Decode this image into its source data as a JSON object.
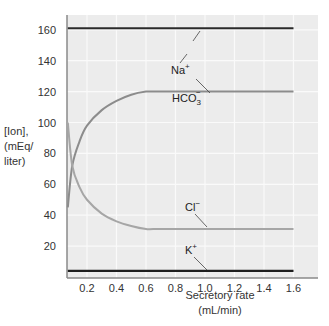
{
  "chart_data": {
    "type": "line",
    "title": "",
    "xlabel": "Secretory rate (mL/min)",
    "xlabel_lines": [
      "Secretory rate",
      "(mL/min)"
    ],
    "ylabel": "[Ion], (mEq/liter)",
    "ylabel_lines": [
      "[Ion],",
      "(mEq/",
      "liter)"
    ],
    "xlim": [
      0.07,
      1.75
    ],
    "ylim": [
      0,
      170
    ],
    "x_ticks": [
      0.2,
      0.4,
      0.6,
      0.8,
      1.0,
      1.2,
      1.4,
      1.6
    ],
    "x_tick_labels": [
      "0.2",
      "0.4",
      "0.6",
      "0.8",
      "1.0",
      "1.2",
      "1.4",
      "1.6"
    ],
    "y_ticks": [
      20,
      40,
      60,
      80,
      100,
      120,
      140,
      160
    ],
    "y_tick_labels": [
      "20",
      "40",
      "60",
      "80",
      "100",
      "120",
      "140",
      "160"
    ],
    "grid": true,
    "legend": "inline labels with leader lines",
    "series": [
      {
        "name": "Na+",
        "label": "Na",
        "superscript": "+",
        "color": "#2b2b2b",
        "x": [
          0.07,
          1.6
        ],
        "y": [
          161,
          161
        ]
      },
      {
        "name": "HCO3-",
        "label": "HCO",
        "subscript": "3",
        "superscript": "−",
        "color": "#8c8c8c",
        "x": [
          0.07,
          0.1,
          0.15,
          0.2,
          0.3,
          0.4,
          0.5,
          0.6,
          0.65,
          0.8,
          1.0,
          1.2,
          1.4,
          1.6
        ],
        "y": [
          45,
          72,
          88,
          98,
          108,
          114,
          118,
          120,
          120,
          120,
          120,
          120,
          120,
          120
        ]
      },
      {
        "name": "Cl-",
        "label": "Cl",
        "superscript": "−",
        "color": "#a6a6a6",
        "x": [
          0.07,
          0.1,
          0.15,
          0.2,
          0.3,
          0.4,
          0.5,
          0.6,
          0.65,
          0.8,
          1.0,
          1.2,
          1.4,
          1.6
        ],
        "y": [
          100,
          72,
          58,
          50,
          41,
          36,
          33,
          31,
          31,
          31,
          31,
          31,
          31,
          31
        ]
      },
      {
        "name": "K+",
        "label": "K",
        "superscript": "+",
        "color": "#1e1e1e",
        "x": [
          0.07,
          1.6
        ],
        "y": [
          4,
          4
        ]
      }
    ],
    "annotations": [
      {
        "text": "Na+",
        "x": 1.0,
        "y": 152
      },
      {
        "text": "HCO3-",
        "x": 0.97,
        "y": 133
      },
      {
        "text": "Cl-",
        "x": 1.0,
        "y": 43
      },
      {
        "text": "K+",
        "x": 1.0,
        "y": 16
      }
    ]
  },
  "colors": {
    "plot_background": "#ececec",
    "grid": "#fafafa",
    "axis": "#8a8a8a"
  }
}
